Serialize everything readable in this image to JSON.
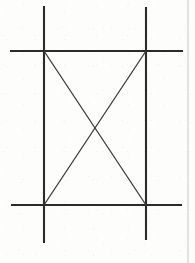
{
  "figure": {
    "canvas": {
      "width": 195,
      "height": 263,
      "background_color": "#fdfdfc"
    },
    "style": {
      "line_color": "#2b2b2b",
      "diagonal_color": "#3a3a3a",
      "border_color": "#c9c9c9",
      "line_width": 2.1,
      "diagonal_width": 1.3,
      "border_width": 1
    },
    "corners": {
      "top_left": {
        "x": 44,
        "y": 51
      },
      "top_right": {
        "x": 146,
        "y": 51
      },
      "bottom_left": {
        "x": 44,
        "y": 205
      },
      "bottom_right": {
        "x": 146,
        "y": 205
      },
      "center": {
        "x": 95,
        "y": 128
      }
    },
    "lines": [
      {
        "name": "vertical-left",
        "kind": "vertical",
        "x1": 44,
        "y1": 6,
        "x2": 44,
        "y2": 243
      },
      {
        "name": "vertical-right",
        "kind": "vertical",
        "x1": 146,
        "y1": 7,
        "x2": 146,
        "y2": 240
      },
      {
        "name": "horizontal-top",
        "kind": "horizontal",
        "x1": 10,
        "y1": 51,
        "x2": 183,
        "y2": 51
      },
      {
        "name": "horizontal-bottom",
        "kind": "horizontal",
        "x1": 11,
        "y1": 205,
        "x2": 182,
        "y2": 205
      }
    ],
    "diagonals": [
      {
        "name": "diagonal-top-left-to-bottom-right",
        "kind": "diagonal",
        "x1": 44,
        "y1": 51,
        "x2": 146,
        "y2": 205
      },
      {
        "name": "diagonal-top-right-to-bottom-left",
        "kind": "diagonal",
        "x1": 146,
        "y1": 51,
        "x2": 44,
        "y2": 205
      }
    ],
    "page_border": {
      "name": "page-edge-rule",
      "x1": 188,
      "y1": 0,
      "x2": 188,
      "y2": 263
    }
  }
}
